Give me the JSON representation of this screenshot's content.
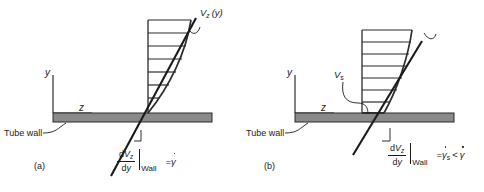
{
  "figure": {
    "background_color": "#ffffff",
    "ink_color": "#1a1a1a",
    "wall_color": "#8a8a8a",
    "panels": [
      {
        "id": "a",
        "panel_label": "(a)",
        "axis_y_label": "y",
        "axis_z_label": "z",
        "wall_label": "Tube wall",
        "profile_label": "V",
        "profile_label_sub": "z",
        "profile_label_arg": "(y)",
        "equation": {
          "numerator_d": "d",
          "numerator_var": "V",
          "numerator_sub": "z",
          "denominator_d": "d",
          "denominator_var": "y",
          "evaluated_at": "Wall",
          "equals": "=",
          "rhs": "γ"
        },
        "condition": "no-slip",
        "rung_count": 7,
        "slip_velocity": 0
      },
      {
        "id": "b",
        "panel_label": "(b)",
        "axis_y_label": "y",
        "axis_z_label": "z",
        "wall_label": "Tube wall",
        "profile_label": "V",
        "profile_label_sub": "s",
        "profile_label_arg": "",
        "equation": {
          "numerator_d": "d",
          "numerator_var": "V",
          "numerator_sub": "z",
          "denominator_d": "d",
          "denominator_var": "y",
          "evaluated_at": "Wall",
          "equals": "=",
          "rhs": "γ",
          "rhs_sub": "s",
          "comparison": "<",
          "rhs2": "γ"
        },
        "condition": "slip",
        "rung_count": 7,
        "slip_velocity": 1
      }
    ]
  }
}
